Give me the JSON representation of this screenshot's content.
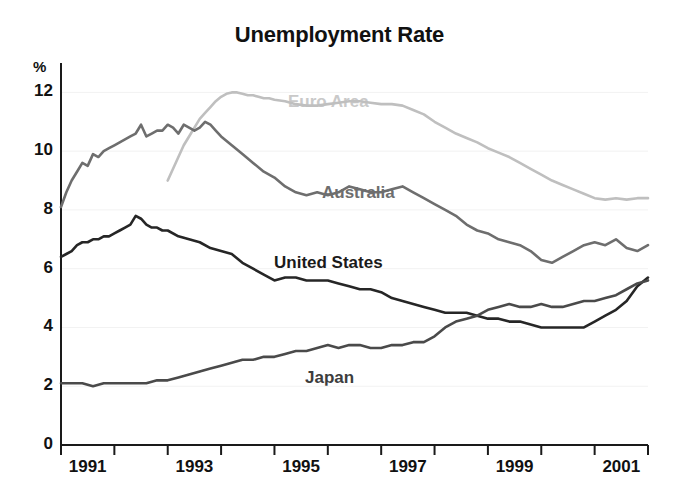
{
  "chart_data": {
    "type": "line",
    "title": "Unemployment Rate",
    "xlabel": "",
    "ylabel": "%",
    "ylim": [
      0,
      13
    ],
    "xlim": [
      1991.0,
      2002.0
    ],
    "yticks": [
      "0",
      "2",
      "4",
      "6",
      "8",
      "10",
      "12"
    ],
    "ytick_values": [
      0,
      2,
      4,
      6,
      8,
      10,
      12
    ],
    "xticks": [
      "1991",
      "1993",
      "1995",
      "1997",
      "1999",
      "2001"
    ],
    "xtick_values": [
      1991,
      1993,
      1995,
      1997,
      1999,
      2001
    ],
    "grid": false,
    "legend": "inline-labels",
    "series": [
      {
        "name": "Euro Area",
        "color": "#bfbfbf",
        "label_color": "#c9c9c9",
        "label_x": 288,
        "label_y": 92,
        "x": [
          1993.0,
          1993.1,
          1993.2,
          1993.3,
          1993.4,
          1993.5,
          1993.6,
          1993.7,
          1993.8,
          1993.9,
          1994.0,
          1994.1,
          1994.2,
          1994.3,
          1994.4,
          1994.5,
          1994.6,
          1994.7,
          1994.8,
          1994.9,
          1995.0,
          1995.2,
          1995.4,
          1995.6,
          1995.8,
          1996.0,
          1996.2,
          1996.4,
          1996.6,
          1996.8,
          1997.0,
          1997.2,
          1997.4,
          1997.6,
          1997.8,
          1998.0,
          1998.2,
          1998.4,
          1998.6,
          1998.8,
          1999.0,
          1999.2,
          1999.4,
          1999.6,
          1999.8,
          2000.0,
          2000.2,
          2000.4,
          2000.6,
          2000.8,
          2001.0,
          2001.2,
          2001.4,
          2001.6,
          2001.8,
          2002.0
        ],
        "y": [
          9.0,
          9.4,
          9.8,
          10.2,
          10.5,
          10.8,
          11.1,
          11.3,
          11.5,
          11.7,
          11.85,
          11.95,
          12.0,
          12.0,
          11.95,
          11.9,
          11.9,
          11.85,
          11.8,
          11.8,
          11.75,
          11.7,
          11.6,
          11.55,
          11.55,
          11.6,
          11.65,
          11.7,
          11.7,
          11.65,
          11.6,
          11.6,
          11.55,
          11.4,
          11.25,
          11.0,
          10.8,
          10.6,
          10.45,
          10.3,
          10.1,
          9.95,
          9.8,
          9.6,
          9.4,
          9.2,
          9.0,
          8.85,
          8.7,
          8.55,
          8.4,
          8.35,
          8.4,
          8.35,
          8.4,
          8.4
        ]
      },
      {
        "name": "Australia",
        "color": "#6e6e6e",
        "label_color": "#6e6e6e",
        "label_x": 322,
        "label_y": 183,
        "x": [
          1991.0,
          1991.1,
          1991.2,
          1991.3,
          1991.4,
          1991.5,
          1991.6,
          1991.7,
          1991.8,
          1991.9,
          1992.0,
          1992.1,
          1992.2,
          1992.3,
          1992.4,
          1992.5,
          1992.6,
          1992.7,
          1992.8,
          1992.9,
          1993.0,
          1993.1,
          1993.2,
          1993.3,
          1993.4,
          1993.5,
          1993.6,
          1993.7,
          1993.8,
          1993.9,
          1994.0,
          1994.2,
          1994.4,
          1994.6,
          1994.8,
          1995.0,
          1995.2,
          1995.4,
          1995.6,
          1995.8,
          1996.0,
          1996.2,
          1996.4,
          1996.6,
          1996.8,
          1997.0,
          1997.2,
          1997.4,
          1997.6,
          1997.8,
          1998.0,
          1998.2,
          1998.4,
          1998.6,
          1998.8,
          1999.0,
          1999.2,
          1999.4,
          1999.6,
          1999.8,
          2000.0,
          2000.2,
          2000.4,
          2000.6,
          2000.8,
          2001.0,
          2001.2,
          2001.4,
          2001.6,
          2001.8,
          2002.0
        ],
        "y": [
          8.1,
          8.6,
          9.0,
          9.3,
          9.6,
          9.5,
          9.9,
          9.8,
          10.0,
          10.1,
          10.2,
          10.3,
          10.4,
          10.5,
          10.6,
          10.9,
          10.5,
          10.6,
          10.7,
          10.7,
          10.9,
          10.8,
          10.6,
          10.9,
          10.8,
          10.7,
          10.8,
          11.0,
          10.9,
          10.7,
          10.5,
          10.2,
          9.9,
          9.6,
          9.3,
          9.1,
          8.8,
          8.6,
          8.5,
          8.6,
          8.5,
          8.6,
          8.8,
          8.7,
          8.6,
          8.6,
          8.7,
          8.8,
          8.6,
          8.4,
          8.2,
          8.0,
          7.8,
          7.5,
          7.3,
          7.2,
          7.0,
          6.9,
          6.8,
          6.6,
          6.3,
          6.2,
          6.4,
          6.6,
          6.8,
          6.9,
          6.8,
          7.0,
          6.7,
          6.6,
          6.8
        ]
      },
      {
        "name": "United States",
        "color": "#262626",
        "label_color": "#1a1a1a",
        "label_x": 274,
        "label_y": 253,
        "x": [
          1991.0,
          1991.1,
          1991.2,
          1991.3,
          1991.4,
          1991.5,
          1991.6,
          1991.7,
          1991.8,
          1991.9,
          1992.0,
          1992.1,
          1992.2,
          1992.3,
          1992.4,
          1992.5,
          1992.6,
          1992.7,
          1992.8,
          1992.9,
          1993.0,
          1993.2,
          1993.4,
          1993.6,
          1993.8,
          1994.0,
          1994.2,
          1994.4,
          1994.6,
          1994.8,
          1995.0,
          1995.2,
          1995.4,
          1995.6,
          1995.8,
          1996.0,
          1996.2,
          1996.4,
          1996.6,
          1996.8,
          1997.0,
          1997.2,
          1997.4,
          1997.6,
          1997.8,
          1998.0,
          1998.2,
          1998.4,
          1998.6,
          1998.8,
          1999.0,
          1999.2,
          1999.4,
          1999.6,
          1999.8,
          2000.0,
          2000.2,
          2000.4,
          2000.6,
          2000.8,
          2001.0,
          2001.2,
          2001.4,
          2001.6,
          2001.8,
          2002.0
        ],
        "y": [
          6.4,
          6.5,
          6.6,
          6.8,
          6.9,
          6.9,
          7.0,
          7.0,
          7.1,
          7.1,
          7.2,
          7.3,
          7.4,
          7.5,
          7.8,
          7.7,
          7.5,
          7.4,
          7.4,
          7.3,
          7.3,
          7.1,
          7.0,
          6.9,
          6.7,
          6.6,
          6.5,
          6.2,
          6.0,
          5.8,
          5.6,
          5.7,
          5.7,
          5.6,
          5.6,
          5.6,
          5.5,
          5.4,
          5.3,
          5.3,
          5.2,
          5.0,
          4.9,
          4.8,
          4.7,
          4.6,
          4.5,
          4.5,
          4.5,
          4.4,
          4.3,
          4.3,
          4.2,
          4.2,
          4.1,
          4.0,
          4.0,
          4.0,
          4.0,
          4.0,
          4.2,
          4.4,
          4.6,
          4.9,
          5.4,
          5.7
        ]
      },
      {
        "name": "Japan",
        "color": "#4a4a4a",
        "label_color": "#3d3d3d",
        "label_x": 305,
        "label_y": 368,
        "x": [
          1991.0,
          1991.2,
          1991.4,
          1991.6,
          1991.8,
          1992.0,
          1992.2,
          1992.4,
          1992.6,
          1992.8,
          1993.0,
          1993.2,
          1993.4,
          1993.6,
          1993.8,
          1994.0,
          1994.2,
          1994.4,
          1994.6,
          1994.8,
          1995.0,
          1995.2,
          1995.4,
          1995.6,
          1995.8,
          1996.0,
          1996.2,
          1996.4,
          1996.6,
          1996.8,
          1997.0,
          1997.2,
          1997.4,
          1997.6,
          1997.8,
          1998.0,
          1998.2,
          1998.4,
          1998.6,
          1998.8,
          1999.0,
          1999.2,
          1999.4,
          1999.6,
          1999.8,
          2000.0,
          2000.2,
          2000.4,
          2000.6,
          2000.8,
          2001.0,
          2001.2,
          2001.4,
          2001.6,
          2001.8,
          2002.0
        ],
        "y": [
          2.1,
          2.1,
          2.1,
          2.0,
          2.1,
          2.1,
          2.1,
          2.1,
          2.1,
          2.2,
          2.2,
          2.3,
          2.4,
          2.5,
          2.6,
          2.7,
          2.8,
          2.9,
          2.9,
          3.0,
          3.0,
          3.1,
          3.2,
          3.2,
          3.3,
          3.4,
          3.3,
          3.4,
          3.4,
          3.3,
          3.3,
          3.4,
          3.4,
          3.5,
          3.5,
          3.7,
          4.0,
          4.2,
          4.3,
          4.4,
          4.6,
          4.7,
          4.8,
          4.7,
          4.7,
          4.8,
          4.7,
          4.7,
          4.8,
          4.9,
          4.9,
          5.0,
          5.1,
          5.3,
          5.5,
          5.6
        ]
      }
    ]
  },
  "axes": {
    "unit_label": "%",
    "plot_left_px": 61,
    "plot_right_px": 648,
    "plot_top_px": 63,
    "plot_bottom_px": 445
  }
}
